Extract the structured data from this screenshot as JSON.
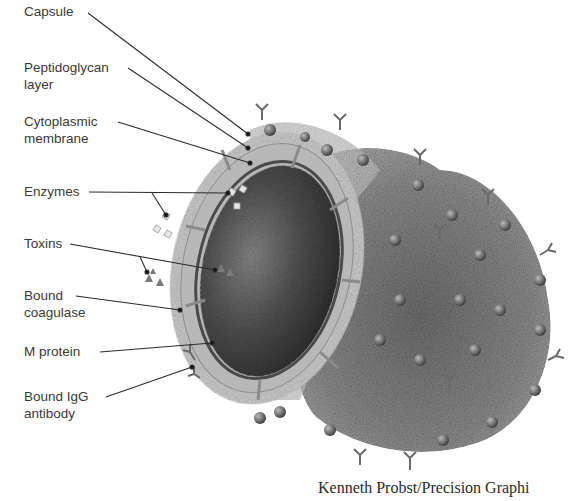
{
  "diagram": {
    "labels": [
      {
        "id": "capsule",
        "lines": [
          "Capsule"
        ]
      },
      {
        "id": "peptidoglycan",
        "lines": [
          "Peptidoglycan",
          "layer"
        ]
      },
      {
        "id": "cytoplasmic",
        "lines": [
          "Cytoplasmic",
          "membrane"
        ]
      },
      {
        "id": "enzymes",
        "lines": [
          "Enzymes"
        ]
      },
      {
        "id": "toxins",
        "lines": [
          "Toxins"
        ]
      },
      {
        "id": "coagulase",
        "lines": [
          "Bound",
          "coagulase"
        ]
      },
      {
        "id": "mprotein",
        "lines": [
          "M protein"
        ]
      },
      {
        "id": "igg",
        "lines": [
          "Bound IgG",
          "antibody"
        ]
      }
    ],
    "credit": "Kenneth Probst/Precision Graphi"
  },
  "colors": {
    "background": "#ffffff",
    "text": "#3a3a3a",
    "leader": "#2b2b2b",
    "cytoplasm_dark": "#2e2e2e",
    "cytoplasm_light": "#9a9a9a",
    "wall": "#b5b5b5",
    "capsule": "#cfcfcf",
    "clot": "#8a8a8a"
  }
}
